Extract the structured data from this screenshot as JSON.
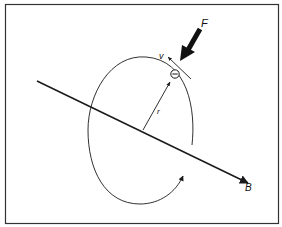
{
  "diagram": {
    "labels": {
      "force": "F",
      "velocity": "v",
      "radius": "r",
      "field": "B",
      "charge": "−"
    },
    "colors": {
      "stroke": "#1a1a1a",
      "frame": "#333333",
      "background": "#ffffff"
    }
  }
}
